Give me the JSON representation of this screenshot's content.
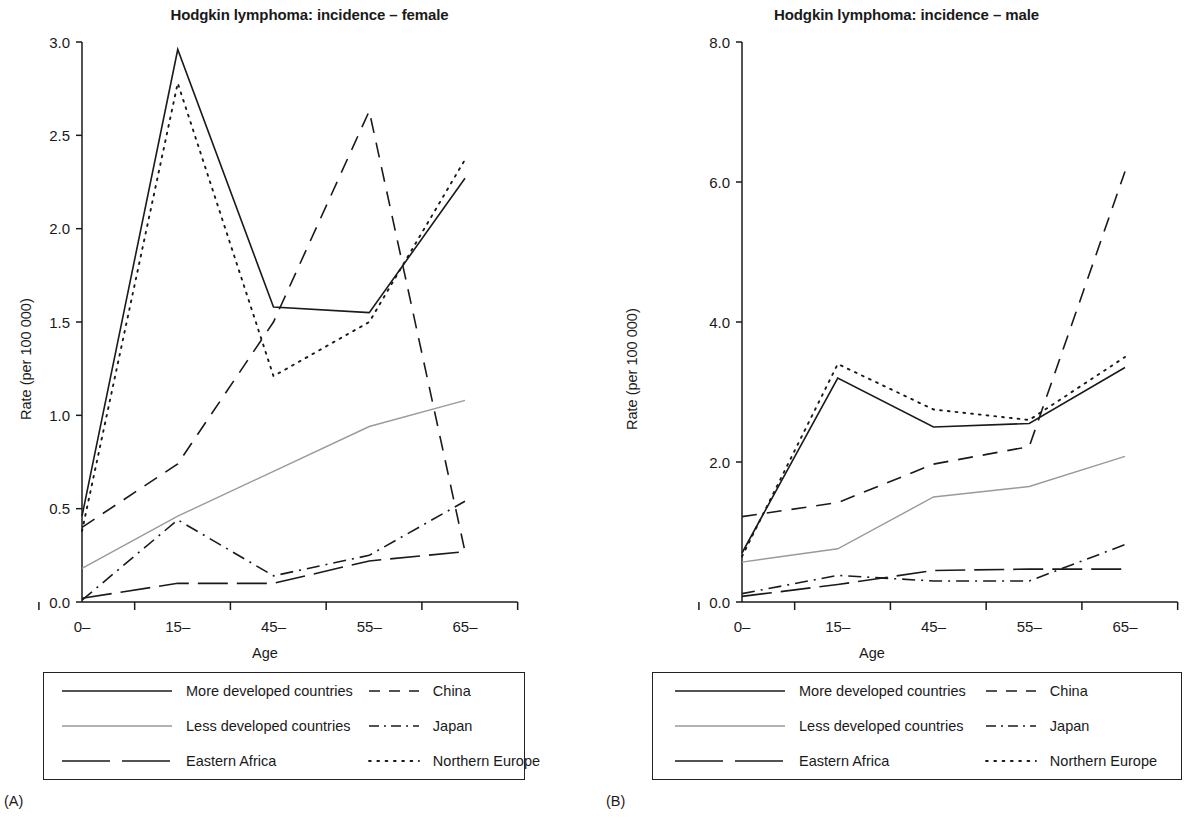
{
  "figure": {
    "panels": [
      {
        "letter": "(A)",
        "title": "Hodgkin lymphoma: incidence – female",
        "ylabel": "Rate (per 100 000)",
        "xlabel": "Age"
      },
      {
        "letter": "(B)",
        "title": "Hodgkin lymphoma: incidence – male",
        "ylabel": "Rate (per 100 000)",
        "xlabel": "Age"
      }
    ],
    "legend": {
      "entries": [
        {
          "label": "More developed countries",
          "style": "solid",
          "color": "#1a1a1a"
        },
        {
          "label": "China",
          "style": "dashed-medium",
          "color": "#1a1a1a"
        },
        {
          "label": "Less developed countries",
          "style": "solid-light",
          "color": "#9a9a9a"
        },
        {
          "label": "Japan",
          "style": "dash-dot",
          "color": "#1a1a1a"
        },
        {
          "label": "Eastern Africa",
          "style": "dashed-long",
          "color": "#1a1a1a"
        },
        {
          "label": "Northern Europe",
          "style": "dotted",
          "color": "#1a1a1a"
        }
      ]
    }
  },
  "chart_data": [
    {
      "type": "line",
      "panel": "A",
      "title": "Hodgkin lymphoma: incidence – female",
      "xlabel": "Age",
      "ylabel": "Rate (per 100 000)",
      "categories": [
        "0–",
        "15–",
        "45–",
        "55–",
        "65–"
      ],
      "xtick_labels": [
        "0–",
        "15–",
        "45–",
        "55–",
        "65–"
      ],
      "ytick_labels": [
        "0.0",
        "0.5",
        "1.0",
        "1.5",
        "2.0",
        "2.5",
        "3.0"
      ],
      "ylim": [
        0.0,
        3.0
      ],
      "ytick_values": [
        0.0,
        0.5,
        1.0,
        1.5,
        2.0,
        2.5,
        3.0
      ],
      "grid": false,
      "legend_position": "below",
      "series": [
        {
          "name": "More developed countries",
          "style": "solid",
          "color": "#1a1a1a",
          "values": [
            0.46,
            2.96,
            1.58,
            1.55,
            2.27
          ]
        },
        {
          "name": "Less developed countries",
          "style": "solid-light",
          "color": "#9a9a9a",
          "values": [
            0.18,
            0.46,
            0.7,
            0.94,
            1.08
          ]
        },
        {
          "name": "Eastern Africa",
          "style": "dashed-long",
          "color": "#1a1a1a",
          "values": [
            0.02,
            0.1,
            0.1,
            0.22,
            0.27
          ]
        },
        {
          "name": "China",
          "style": "dashed-medium",
          "color": "#1a1a1a",
          "values": [
            0.4,
            0.74,
            1.5,
            2.63,
            0.27
          ]
        },
        {
          "name": "Japan",
          "style": "dash-dot",
          "color": "#1a1a1a",
          "values": [
            0.01,
            0.44,
            0.14,
            0.25,
            0.54
          ]
        },
        {
          "name": "Northern Europe",
          "style": "dotted",
          "color": "#1a1a1a",
          "values": [
            0.38,
            2.78,
            1.21,
            1.5,
            2.37
          ]
        }
      ]
    },
    {
      "type": "line",
      "panel": "B",
      "title": "Hodgkin lymphoma: incidence – male",
      "xlabel": "Age",
      "ylabel": "Rate (per 100 000)",
      "categories": [
        "0–",
        "15–",
        "45–",
        "55–",
        "65–"
      ],
      "xtick_labels": [
        "0–",
        "15–",
        "45–",
        "55–",
        "65–"
      ],
      "ytick_labels": [
        "0.0",
        "2.0",
        "4.0",
        "6.0",
        "8.0"
      ],
      "ylim": [
        0.0,
        8.0
      ],
      "ytick_values": [
        0.0,
        2.0,
        4.0,
        6.0,
        8.0
      ],
      "grid": false,
      "legend_position": "below",
      "series": [
        {
          "name": "More developed countries",
          "style": "solid",
          "color": "#1a1a1a",
          "values": [
            0.7,
            3.2,
            2.5,
            2.55,
            3.35
          ]
        },
        {
          "name": "Less developed countries",
          "style": "solid-light",
          "color": "#9a9a9a",
          "values": [
            0.57,
            0.76,
            1.5,
            1.65,
            2.08
          ]
        },
        {
          "name": "Eastern Africa",
          "style": "dashed-long",
          "color": "#1a1a1a",
          "values": [
            0.08,
            0.25,
            0.45,
            0.47,
            0.47
          ]
        },
        {
          "name": "China",
          "style": "dashed-medium",
          "color": "#1a1a1a",
          "values": [
            1.22,
            1.42,
            1.97,
            2.22,
            6.15
          ]
        },
        {
          "name": "Japan",
          "style": "dash-dot",
          "color": "#1a1a1a",
          "values": [
            0.12,
            0.38,
            0.3,
            0.3,
            0.82
          ]
        },
        {
          "name": "Northern Europe",
          "style": "dotted",
          "color": "#1a1a1a",
          "values": [
            0.65,
            3.4,
            2.75,
            2.6,
            3.5
          ]
        }
      ]
    }
  ]
}
